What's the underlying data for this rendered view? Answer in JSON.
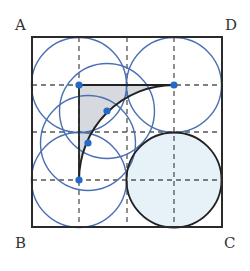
{
  "diagram": {
    "type": "geometry-square-with-circles",
    "labels": {
      "A": "A",
      "B": "B",
      "C": "C",
      "D": "D"
    },
    "square": {
      "x": 32,
      "y": 37,
      "size": 190
    },
    "grid": {
      "divisions": 4,
      "style": "dashed"
    },
    "colors": {
      "square_stroke": "#2a2a2a",
      "grid_dash": "#555555",
      "blue_circle": "#4a6fb5",
      "dot": "#2468c8",
      "shaded_region": "#d6d9de",
      "filled_circle": "#e6f1f8",
      "arc": "#222222"
    },
    "blue_circles": [
      {
        "name": "circle-top-left",
        "cx": 79,
        "cy": 85,
        "r": 47.5
      },
      {
        "name": "circle-top-right",
        "cx": 174,
        "cy": 85,
        "r": 47.5
      },
      {
        "name": "circle-bottom-left",
        "cx": 79,
        "cy": 180,
        "r": 47.5
      },
      {
        "name": "circle-on-arc-upper",
        "cx": 107,
        "cy": 111,
        "r": 47.5
      },
      {
        "name": "circle-on-arc-lower",
        "cx": 88,
        "cy": 143,
        "r": 47.5
      }
    ],
    "filled_circle": {
      "cx": 174,
      "cy": 180,
      "r": 47.5
    },
    "arc": {
      "center": [
        174,
        180
      ],
      "r": 95,
      "from": [
        79,
        180
      ],
      "to": [
        174,
        85
      ]
    },
    "dots": [
      {
        "name": "dot-top-left-center",
        "x": 79,
        "y": 85
      },
      {
        "name": "dot-top-right-center",
        "x": 174,
        "y": 85
      },
      {
        "name": "dot-arc-upper",
        "x": 107,
        "y": 111
      },
      {
        "name": "dot-arc-lower",
        "x": 88,
        "y": 143
      },
      {
        "name": "dot-bottom-left-center",
        "x": 79,
        "y": 180
      }
    ]
  }
}
